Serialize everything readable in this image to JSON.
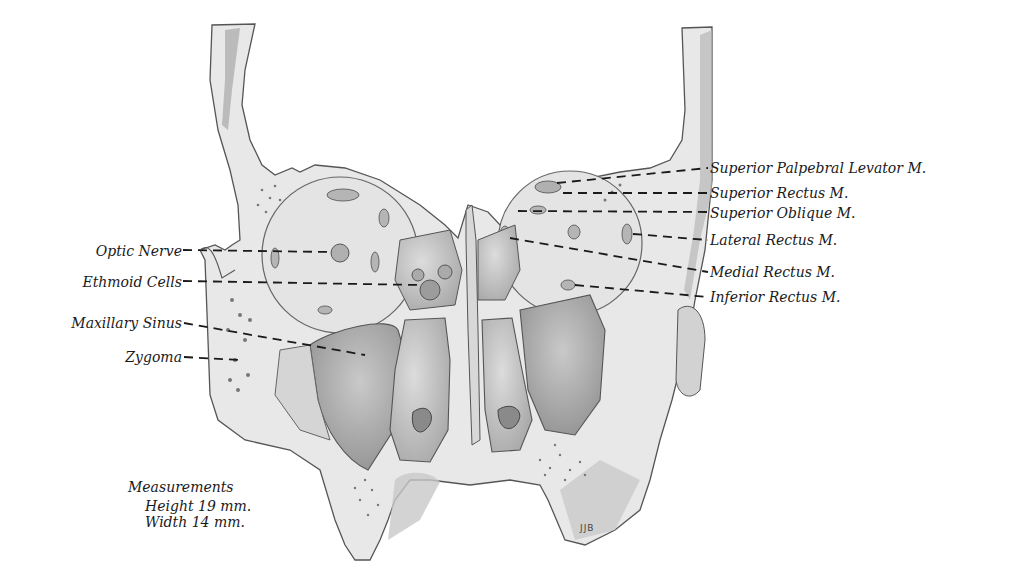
{
  "figure": {
    "signature": "JJB",
    "colors": {
      "bone": "#e6e6e6",
      "bone_edge": "#555555",
      "cavity_dark": "#9a9a9a",
      "cavity_mid": "#bdbdbd",
      "leader": "#1a1a1a",
      "background": "#ffffff"
    }
  },
  "labels_left": [
    {
      "id": "optic-nerve",
      "text": "Optic Nerve"
    },
    {
      "id": "ethmoid-cells",
      "text": "Ethmoid Cells"
    },
    {
      "id": "maxillary-sinus",
      "text": "Maxillary Sinus"
    },
    {
      "id": "zygoma",
      "text": "Zygoma"
    }
  ],
  "labels_right": [
    {
      "id": "superior-palpebral-levator",
      "text": "Superior Palpebral Levator M."
    },
    {
      "id": "superior-rectus",
      "text": "Superior Rectus M."
    },
    {
      "id": "superior-oblique",
      "text": "Superior Oblique M."
    },
    {
      "id": "lateral-rectus",
      "text": "Lateral Rectus M."
    },
    {
      "id": "medial-rectus",
      "text": "Medial Rectus M."
    },
    {
      "id": "inferior-rectus",
      "text": "Inferior Rectus M."
    }
  ],
  "measurements": {
    "title": "Measurements",
    "height": "Height 19 mm.",
    "width": "Width 14 mm."
  }
}
